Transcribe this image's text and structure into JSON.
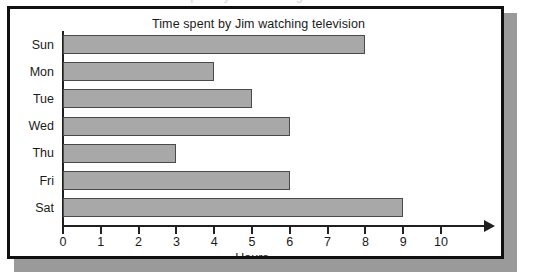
{
  "panel": {
    "border_color": "#101010",
    "background_color": "#ffffff",
    "shadow_color": "#9a9a9a",
    "top_artifact_text": "Time spent by Jim watching television"
  },
  "chart_data": {
    "type": "bar",
    "orientation": "horizontal",
    "title": "Time spent by Jim watching television",
    "xlabel": "Hours",
    "ylabel": "",
    "categories": [
      "Sun",
      "Mon",
      "Tue",
      "Wed",
      "Thu",
      "Fri",
      "Sat"
    ],
    "values": [
      8,
      4,
      5,
      6,
      3,
      6,
      9
    ],
    "xlim": [
      0,
      10
    ],
    "xticks": [
      0,
      1,
      2,
      3,
      4,
      5,
      6,
      7,
      8,
      9,
      10
    ],
    "xtick_labels": [
      "0",
      "1",
      "2",
      "3",
      "4",
      "5",
      "6",
      "7",
      "8",
      "9",
      "10"
    ],
    "grid": false,
    "legend": null,
    "bar_fill_color": "#a8a8a8",
    "bar_edge_color": "#4a4a4a",
    "axis_color": "#202020",
    "axis_arrow": true,
    "units": "hours"
  }
}
